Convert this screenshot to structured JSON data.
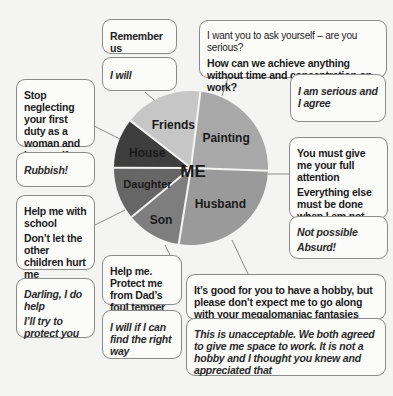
{
  "center_label": "ME",
  "segments": [
    {
      "name": "Painting",
      "share": 0.236,
      "color": "#a8a8a8"
    },
    {
      "name": "Husband",
      "share": 0.27,
      "color": "#9a9a9a"
    },
    {
      "name": "Son",
      "share": 0.115,
      "color": "#7e7e7e"
    },
    {
      "name": "Daughter",
      "share": 0.11,
      "color": "#666666"
    },
    {
      "name": "House",
      "share": 0.105,
      "color": "#3e3e3e"
    },
    {
      "name": "Friends",
      "share": 0.164,
      "color": "#c6c6c6"
    }
  ],
  "bubbles": {
    "friends_demand": [
      "Remember us"
    ],
    "friends_reply": [
      "I will"
    ],
    "painting_demand": [
      "I want you to ask yourself – are you serious?",
      "How can we achieve anything without time and concentration on work?"
    ],
    "painting_reply": [
      "I am serious and I agree"
    ],
    "house_demand": [
      "Stop neglecting your first duty as a woman and housewife"
    ],
    "house_reply": [
      "Rubbish!"
    ],
    "husband_demand": [
      "You must give me your full attention",
      "Everything else must be done when I am not there"
    ],
    "husband_reply": [
      "Not possible",
      "Absurd!"
    ],
    "daughter_demand": [
      "Help me with school",
      "Don’t let the other children hurt me"
    ],
    "daughter_reply": [
      "Darling, I do help",
      "I’ll try to protect you"
    ],
    "son_demand": [
      "Help me. Protect me from Dad’s foul temper"
    ],
    "son_reply": [
      "I will if I can find the right way"
    ],
    "husband_painting_demand": [
      "It’s good for you to have a hobby, but please don’t expect me to go along with your megalomaniac fantasies"
    ],
    "husband_painting_reply": [
      "This is unacceptable. We both agreed to give me space to work. It is not a hobby and I thought you knew and appreciated that"
    ]
  }
}
